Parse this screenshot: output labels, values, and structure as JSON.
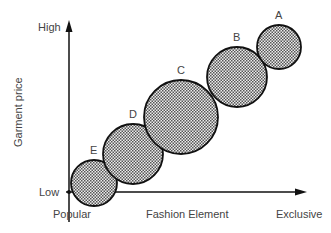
{
  "diagram": {
    "y_axis": {
      "title": "Garment price",
      "high_label": "High",
      "low_label": "Low"
    },
    "x_axis": {
      "title": "Fashion Element",
      "left_label": "Popular",
      "right_label": "Exclusive"
    },
    "circles": [
      {
        "label": "A",
        "cx": 279,
        "cy": 47,
        "r": 22
      },
      {
        "label": "B",
        "cx": 237,
        "cy": 77,
        "r": 30
      },
      {
        "label": "C",
        "cx": 181,
        "cy": 117,
        "r": 37
      },
      {
        "label": "D",
        "cx": 133,
        "cy": 154,
        "r": 30
      },
      {
        "label": "E",
        "cx": 94,
        "cy": 183,
        "r": 23
      }
    ],
    "colors": {
      "stroke": "#111111",
      "fill_dot": "#555555",
      "fill_bg": "#e8e8e8"
    }
  }
}
